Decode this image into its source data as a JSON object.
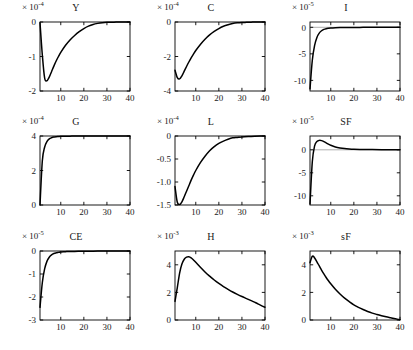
{
  "figure": {
    "rows": 3,
    "cols": 3,
    "background": "#ffffff",
    "curve_color": "#000000",
    "axis_color": "#000000",
    "zero_line_color": "#9a9a9a"
  },
  "chart_data": [
    {
      "type": "line",
      "title": "Y",
      "exponent_label": "× 10",
      "exponent_sup": "-4",
      "scale": 0.0001,
      "xlabel": "",
      "ylabel": "",
      "xlim": [
        1,
        40
      ],
      "ylim": [
        -2,
        0
      ],
      "xticks": [
        10,
        20,
        30,
        40
      ],
      "xtick_labels": [
        "10",
        "20",
        "30",
        "40"
      ],
      "yticks": [
        0,
        -1,
        -2
      ],
      "ytick_labels": [
        "0",
        "-1",
        "-2"
      ],
      "grid": false,
      "legend": "none",
      "x": [
        1,
        2,
        3,
        4,
        5,
        6,
        7,
        8,
        9,
        10,
        12,
        14,
        16,
        18,
        20,
        22,
        24,
        26,
        28,
        30,
        32,
        34,
        36,
        38,
        40
      ],
      "values": [
        -0.02,
        -0.95,
        -1.62,
        -1.7,
        -1.6,
        -1.44,
        -1.28,
        -1.13,
        -1.0,
        -0.88,
        -0.68,
        -0.52,
        -0.39,
        -0.28,
        -0.19,
        -0.12,
        -0.07,
        -0.04,
        -0.02,
        -0.01,
        -0.01,
        0.0,
        0.0,
        0.0,
        0.0
      ]
    },
    {
      "type": "line",
      "title": "C",
      "exponent_label": "× 10",
      "exponent_sup": "-4",
      "scale": 0.0001,
      "xlabel": "",
      "ylabel": "",
      "xlim": [
        1,
        40
      ],
      "ylim": [
        -4,
        0
      ],
      "xticks": [
        10,
        20,
        30,
        40
      ],
      "xtick_labels": [
        "10",
        "20",
        "30",
        "40"
      ],
      "yticks": [
        0,
        -2,
        -4
      ],
      "ytick_labels": [
        "0",
        "-2",
        "-4"
      ],
      "grid": false,
      "legend": "none",
      "x": [
        1,
        2,
        3,
        4,
        5,
        6,
        7,
        8,
        9,
        10,
        12,
        14,
        16,
        18,
        20,
        22,
        24,
        26,
        28,
        30,
        32,
        34,
        36,
        38,
        40
      ],
      "values": [
        -2.8,
        -3.22,
        -3.3,
        -3.12,
        -2.85,
        -2.58,
        -2.32,
        -2.08,
        -1.86,
        -1.65,
        -1.3,
        -1.0,
        -0.75,
        -0.55,
        -0.38,
        -0.25,
        -0.16,
        -0.09,
        -0.05,
        -0.03,
        -0.02,
        -0.01,
        0.0,
        0.0,
        0.0
      ]
    },
    {
      "type": "line",
      "title": "I",
      "exponent_label": "× 10",
      "exponent_sup": "-5",
      "scale": 1e-05,
      "xlabel": "",
      "ylabel": "",
      "xlim": [
        1,
        40
      ],
      "ylim": [
        -12,
        1
      ],
      "xticks": [
        10,
        20,
        30,
        40
      ],
      "xtick_labels": [
        "10",
        "20",
        "30",
        "40"
      ],
      "yticks": [
        0,
        -5,
        -10
      ],
      "ytick_labels": [
        "0",
        "-5",
        "-10"
      ],
      "grid": false,
      "legend": "none",
      "x": [
        1,
        2,
        3,
        4,
        5,
        6,
        7,
        8,
        9,
        10,
        12,
        14,
        16,
        18,
        20,
        24,
        28,
        32,
        36,
        40
      ],
      "values": [
        -11.6,
        -6.2,
        -3.4,
        -1.9,
        -1.1,
        -0.65,
        -0.4,
        -0.26,
        -0.18,
        -0.13,
        -0.08,
        -0.05,
        -0.04,
        -0.03,
        -0.02,
        -0.01,
        -0.01,
        0.0,
        0.0,
        0.0
      ]
    },
    {
      "type": "line",
      "title": "G",
      "exponent_label": "× 10",
      "exponent_sup": "-4",
      "scale": 0.0001,
      "xlabel": "",
      "ylabel": "",
      "xlim": [
        1,
        40
      ],
      "ylim": [
        0,
        4
      ],
      "xticks": [
        10,
        20,
        30,
        40
      ],
      "xtick_labels": [
        "10",
        "20",
        "30",
        "40"
      ],
      "yticks": [
        4,
        2,
        0
      ],
      "ytick_labels": [
        "4",
        "2",
        "0"
      ],
      "grid": false,
      "legend": "none",
      "x": [
        1,
        2,
        3,
        4,
        5,
        6,
        7,
        8,
        9,
        10,
        12,
        14,
        16,
        20,
        24,
        28,
        32,
        36,
        40
      ],
      "values": [
        0.0,
        2.55,
        3.35,
        3.68,
        3.83,
        3.9,
        3.94,
        3.96,
        3.97,
        3.98,
        3.99,
        3.99,
        4.0,
        4.0,
        4.0,
        4.0,
        4.0,
        4.0,
        4.0
      ]
    },
    {
      "type": "line",
      "title": "L",
      "exponent_label": "× 10",
      "exponent_sup": "-4",
      "scale": 0.0001,
      "xlabel": "",
      "ylabel": "",
      "xlim": [
        1,
        40
      ],
      "ylim": [
        -1.5,
        0
      ],
      "xticks": [
        10,
        20,
        30,
        40
      ],
      "xtick_labels": [
        "10",
        "20",
        "30",
        "40"
      ],
      "yticks": [
        0,
        -0.5,
        -1.0,
        -1.5
      ],
      "ytick_labels": [
        "0",
        "-0.5",
        "-1.0",
        "-1.5"
      ],
      "grid": false,
      "legend": "none",
      "x": [
        1,
        2,
        3,
        4,
        5,
        6,
        7,
        8,
        9,
        10,
        12,
        14,
        16,
        18,
        20,
        22,
        24,
        26,
        28,
        30,
        34,
        38,
        40
      ],
      "values": [
        -1.1,
        -1.44,
        -1.49,
        -1.43,
        -1.32,
        -1.2,
        -1.08,
        -0.96,
        -0.85,
        -0.75,
        -0.58,
        -0.44,
        -0.32,
        -0.23,
        -0.16,
        -0.11,
        -0.07,
        -0.04,
        -0.03,
        -0.02,
        -0.01,
        0.0,
        0.0
      ]
    },
    {
      "type": "line",
      "title": "SF",
      "exponent_label": "× 10",
      "exponent_sup": "-5",
      "scale": 1e-05,
      "xlabel": "",
      "ylabel": "",
      "xlim": [
        1,
        40
      ],
      "ylim": [
        -12,
        3
      ],
      "xticks": [
        10,
        20,
        30,
        40
      ],
      "xtick_labels": [
        "10",
        "20",
        "30",
        "40"
      ],
      "yticks": [
        0,
        -5,
        -10
      ],
      "ytick_labels": [
        "0",
        "-5",
        "-10"
      ],
      "grid": false,
      "legend": "none",
      "x": [
        1,
        2,
        3,
        4,
        5,
        6,
        7,
        8,
        9,
        10,
        12,
        14,
        16,
        18,
        20,
        24,
        28,
        32,
        36,
        40
      ],
      "values": [
        -11.8,
        -2.6,
        0.85,
        1.8,
        2.05,
        2.0,
        1.78,
        1.5,
        1.22,
        0.98,
        0.62,
        0.4,
        0.26,
        0.18,
        0.13,
        0.07,
        0.04,
        0.02,
        0.01,
        0.0
      ]
    },
    {
      "type": "line",
      "title": "CE",
      "exponent_label": "× 10",
      "exponent_sup": "-5",
      "scale": 1e-05,
      "xlabel": "",
      "ylabel": "",
      "xlim": [
        1,
        40
      ],
      "ylim": [
        -3,
        0
      ],
      "xticks": [
        10,
        20,
        30,
        40
      ],
      "xtick_labels": [
        "10",
        "20",
        "30",
        "40"
      ],
      "yticks": [
        0,
        -1,
        -2,
        -3
      ],
      "ytick_labels": [
        "0",
        "-1",
        "-2",
        "-3"
      ],
      "grid": false,
      "legend": "none",
      "x": [
        1,
        2,
        3,
        4,
        5,
        6,
        7,
        8,
        9,
        10,
        12,
        14,
        16,
        20,
        24,
        28,
        32,
        36,
        40
      ],
      "values": [
        -2.45,
        -1.38,
        -0.78,
        -0.45,
        -0.27,
        -0.17,
        -0.11,
        -0.08,
        -0.06,
        -0.04,
        -0.03,
        -0.02,
        -0.02,
        -0.01,
        -0.01,
        0.0,
        0.0,
        0.0,
        0.0
      ]
    },
    {
      "type": "line",
      "title": "H",
      "exponent_label": "× 10",
      "exponent_sup": "-3",
      "scale": 0.001,
      "xlabel": "",
      "ylabel": "",
      "xlim": [
        1,
        40
      ],
      "ylim": [
        0,
        5
      ],
      "xticks": [
        10,
        20,
        30,
        40
      ],
      "xtick_labels": [
        "10",
        "20",
        "30",
        "40"
      ],
      "yticks": [
        4,
        2,
        0
      ],
      "ytick_labels": [
        "4",
        "2",
        "0"
      ],
      "grid": false,
      "legend": "none",
      "x": [
        1,
        2,
        3,
        4,
        5,
        6,
        7,
        8,
        9,
        10,
        12,
        14,
        16,
        18,
        20,
        22,
        24,
        26,
        28,
        30,
        32,
        34,
        36,
        38,
        40
      ],
      "values": [
        1.35,
        2.35,
        3.4,
        4.05,
        4.4,
        4.55,
        4.58,
        4.5,
        4.35,
        4.18,
        3.82,
        3.48,
        3.18,
        2.9,
        2.65,
        2.42,
        2.22,
        2.03,
        1.86,
        1.7,
        1.55,
        1.4,
        1.25,
        1.08,
        0.92
      ]
    },
    {
      "type": "line",
      "title": "sF",
      "exponent_label": "× 10",
      "exponent_sup": "-3",
      "scale": 0.001,
      "xlabel": "",
      "ylabel": "",
      "xlim": [
        1,
        40
      ],
      "ylim": [
        0,
        5
      ],
      "xticks": [
        10,
        20,
        30,
        40
      ],
      "xtick_labels": [
        "10",
        "20",
        "30",
        "40"
      ],
      "yticks": [
        4,
        2,
        0
      ],
      "ytick_labels": [
        "4",
        "2",
        "0"
      ],
      "grid": false,
      "legend": "none",
      "x": [
        1,
        2,
        3,
        4,
        5,
        6,
        7,
        8,
        9,
        10,
        12,
        14,
        16,
        18,
        20,
        22,
        24,
        26,
        28,
        30,
        32,
        34,
        36,
        38,
        40
      ],
      "values": [
        4.15,
        4.62,
        4.5,
        4.22,
        3.92,
        3.62,
        3.34,
        3.08,
        2.84,
        2.62,
        2.22,
        1.88,
        1.58,
        1.33,
        1.1,
        0.92,
        0.76,
        0.62,
        0.5,
        0.4,
        0.31,
        0.23,
        0.16,
        0.09,
        0.02
      ]
    }
  ]
}
